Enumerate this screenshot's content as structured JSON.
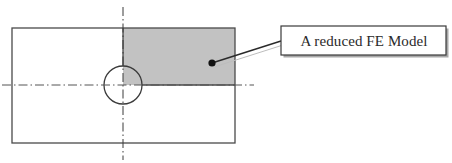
{
  "diagram": {
    "type": "engineering-drawing",
    "colors": {
      "outline": "#4a4a4a",
      "shaded_region": "#c2c2c2",
      "centerline": "#3a3a3a",
      "callout_border": "#3a3a3a",
      "callout_shadow": "#9a9a9a",
      "leader_line": "#2a2a2a",
      "background": "#ffffff"
    },
    "plate": {
      "x": 12,
      "y": 28,
      "width": 223,
      "height": 115
    },
    "hole": {
      "cx": 123,
      "cy": 85,
      "r": 19
    },
    "shaded_quarter": {
      "x": 123,
      "y": 28,
      "width": 112,
      "height": 57
    },
    "centerlines": {
      "vertical": {
        "x": 123,
        "y1": 7,
        "y2": 160
      },
      "horizontal": {
        "y": 85,
        "x1": 2,
        "x2": 254
      }
    },
    "leader": {
      "x1": 212,
      "y1": 63,
      "x2": 281,
      "y2": 41,
      "dot_r": 3.5
    },
    "callout": {
      "label": "A reduced FE Model",
      "x": 281,
      "y": 26,
      "width": 165,
      "height": 29
    }
  }
}
